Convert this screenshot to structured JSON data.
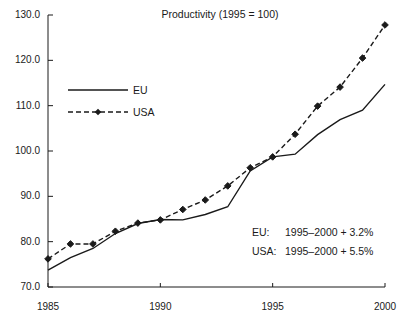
{
  "chart_data": {
    "type": "line",
    "title": "Productivity (1995 = 100)",
    "xlabel": "",
    "ylabel": "",
    "xlim": [
      1985,
      2000
    ],
    "ylim": [
      70.0,
      130.0
    ],
    "grid": false,
    "legend_position": "upper-left-inside",
    "x": [
      1985,
      1986,
      1987,
      1988,
      1989,
      1990,
      1991,
      1992,
      1993,
      1994,
      1995,
      1996,
      1997,
      1998,
      1999,
      2000
    ],
    "xticks": [
      "1985",
      "1990",
      "1995",
      "2000"
    ],
    "xtick_values": [
      1985,
      1990,
      1995,
      2000
    ],
    "yticks": [
      "70.0",
      "80.0",
      "90.0",
      "100.0",
      "110.0",
      "120.0",
      "130.0"
    ],
    "ytick_values": [
      70.0,
      80.0,
      90.0,
      100.0,
      110.0,
      120.0,
      130.0
    ],
    "series": [
      {
        "name": "EU",
        "style": "solid",
        "marker": "none",
        "color": "#1a1a1a",
        "values": [
          73.7,
          76.5,
          78.5,
          81.8,
          84.0,
          84.9,
          84.8,
          86.0,
          87.7,
          95.6,
          98.7,
          99.3,
          103.6,
          106.9,
          109.0,
          114.7
        ]
      },
      {
        "name": "USA",
        "style": "dashed",
        "marker": "diamond",
        "color": "#1a1a1a",
        "values": [
          76.2,
          79.5,
          79.5,
          82.3,
          84.1,
          84.8,
          87.1,
          89.2,
          92.3,
          96.3,
          98.7,
          103.7,
          109.9,
          114.1,
          120.5,
          127.8
        ]
      }
    ],
    "annotations": [
      {
        "key": "EU:",
        "text": "1995–2000 + 3.2%"
      },
      {
        "key": "USA:",
        "text": "1995–2000 + 5.5%"
      }
    ],
    "legend_entries": [
      {
        "label": "EU",
        "style": "solid",
        "marker": "none"
      },
      {
        "label": "USA",
        "style": "dashed",
        "marker": "diamond"
      }
    ]
  }
}
